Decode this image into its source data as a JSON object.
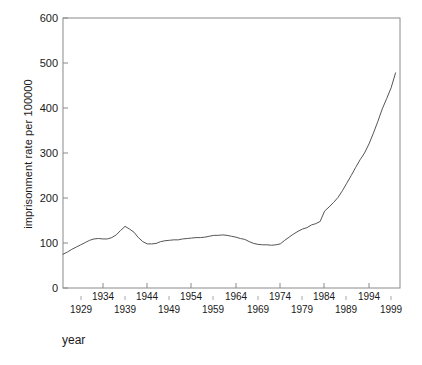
{
  "chart_data": {
    "type": "line",
    "title": "",
    "xlabel": "year",
    "ylabel": "imprisonment rate per 100000",
    "xlim": [
      1925,
      2001
    ],
    "ylim": [
      0,
      600
    ],
    "grid": false,
    "legend": null,
    "y_ticks": [
      0,
      100,
      200,
      300,
      400,
      500,
      600
    ],
    "y_tick_labels": [
      "0",
      "100",
      "200",
      "300",
      "400",
      "500",
      "600"
    ],
    "x_ticks_upper": [
      1934,
      1944,
      1954,
      1964,
      1974,
      1984,
      1994
    ],
    "x_tick_labels_upper": [
      "1934",
      "1944",
      "1954",
      "1964",
      "1974",
      "1984",
      "1994"
    ],
    "x_ticks_lower": [
      1929,
      1939,
      1949,
      1959,
      1969,
      1979,
      1989,
      1999
    ],
    "x_tick_labels_lower": [
      "1929",
      "1939",
      "1949",
      "1959",
      "1969",
      "1979",
      "1989",
      "1999"
    ],
    "line_color": "#555555",
    "x": [
      1925,
      1926,
      1927,
      1928,
      1929,
      1930,
      1931,
      1932,
      1933,
      1934,
      1935,
      1936,
      1937,
      1938,
      1939,
      1940,
      1941,
      1942,
      1943,
      1944,
      1945,
      1946,
      1947,
      1948,
      1949,
      1950,
      1951,
      1952,
      1953,
      1954,
      1955,
      1956,
      1957,
      1958,
      1959,
      1960,
      1961,
      1962,
      1963,
      1964,
      1965,
      1966,
      1967,
      1968,
      1969,
      1970,
      1971,
      1972,
      1973,
      1974,
      1975,
      1976,
      1977,
      1978,
      1979,
      1980,
      1981,
      1982,
      1983,
      1984,
      1985,
      1986,
      1987,
      1988,
      1989,
      1990,
      1991,
      1992,
      1993,
      1994,
      1995,
      1996,
      1997,
      1998,
      1999,
      2000
    ],
    "values": [
      75,
      80,
      86,
      91,
      96,
      101,
      106,
      109,
      110,
      109,
      109,
      112,
      118,
      128,
      137,
      131,
      124,
      112,
      103,
      98,
      98,
      99,
      103,
      105,
      106,
      107,
      107,
      109,
      110,
      111,
      112,
      112,
      113,
      115,
      117,
      117,
      118,
      117,
      115,
      113,
      110,
      108,
      103,
      99,
      97,
      96,
      96,
      95,
      96,
      98,
      106,
      113,
      120,
      126,
      131,
      134,
      140,
      143,
      148,
      171,
      180,
      190,
      201,
      216,
      233,
      250,
      268,
      285,
      300,
      320,
      344,
      370,
      398,
      421,
      445,
      478
    ],
    "units": "per 100,000 population"
  },
  "axes": {
    "frame_color": "#888888"
  }
}
